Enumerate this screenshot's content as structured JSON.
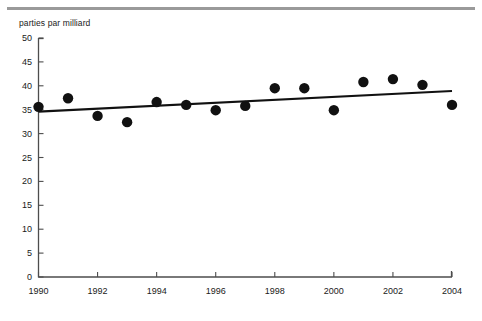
{
  "figure": {
    "top_rule_color": "#9a9a9a",
    "background_color": "#ffffff",
    "point_color": "#111111",
    "trend_color": "#111111",
    "axis_color": "#4d4d4d"
  },
  "chart_data": {
    "type": "scatter",
    "title": "",
    "subtitle": "",
    "xlabel": "",
    "ylabel": "parties par milliard",
    "ylim": [
      0,
      50
    ],
    "xlim": [
      1990,
      2004
    ],
    "grid": false,
    "legend": null,
    "y_ticks": [
      0,
      5,
      10,
      15,
      20,
      25,
      30,
      35,
      40,
      45,
      50
    ],
    "y_tick_labels": [
      "0",
      "5",
      "10",
      "15",
      "20",
      "25",
      "30",
      "35",
      "40",
      "45",
      "50"
    ],
    "x_ticks": [
      1990,
      1992,
      1994,
      1996,
      1998,
      2000,
      2002,
      2004
    ],
    "x_tick_labels": [
      "1990",
      "1992",
      "1994",
      "1996",
      "1998",
      "2000",
      "2002",
      "2004"
    ],
    "x": [
      1990,
      1991,
      1992,
      1993,
      1994,
      1995,
      1996,
      1997,
      1998,
      1999,
      2000,
      2001,
      2002,
      2003,
      2004
    ],
    "values": [
      35.6,
      37.4,
      33.7,
      32.4,
      36.6,
      36.0,
      34.9,
      35.8,
      39.5,
      39.5,
      34.9,
      40.8,
      41.4,
      40.2,
      36.0
    ],
    "series": [
      {
        "name": "parties par milliard",
        "marker": "circle",
        "values": [
          35.6,
          37.4,
          33.7,
          32.4,
          36.6,
          36.0,
          34.9,
          35.8,
          39.5,
          39.5,
          34.9,
          40.8,
          41.4,
          40.2,
          36.0
        ]
      }
    ],
    "annotations": [],
    "trendline": {
      "type": "linear",
      "x_start": 1990,
      "y_start": 34.6,
      "x_end": 2004,
      "y_end": 38.9
    }
  }
}
